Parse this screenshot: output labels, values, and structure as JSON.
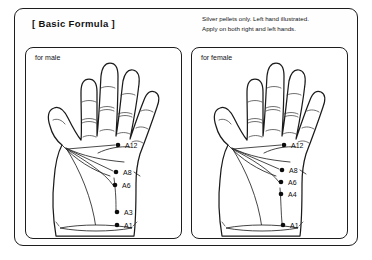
{
  "document": {
    "title": "[ Basic Formula ]",
    "note_lines": [
      "Silver pellets only. Left hand illustrated.",
      "Apply on both right and left hands."
    ]
  },
  "panels": [
    {
      "id": "male",
      "label": "for male",
      "hand": "left-hand-palm",
      "points": [
        {
          "code": "A12",
          "x": 92,
          "y": 97,
          "label_x": 99,
          "label_y": 100
        },
        {
          "code": "A8",
          "x": 90,
          "y": 124,
          "label_x": 97,
          "label_y": 127
        },
        {
          "code": "A6",
          "x": 89,
          "y": 137,
          "label_x": 96,
          "label_y": 140
        },
        {
          "code": "A3",
          "x": 91,
          "y": 164,
          "label_x": 98,
          "label_y": 167
        },
        {
          "code": "A1",
          "x": 91,
          "y": 177,
          "label_x": 98,
          "label_y": 180
        }
      ]
    },
    {
      "id": "female",
      "label": "for female",
      "hand": "left-hand-palm",
      "points": [
        {
          "code": "A12",
          "x": 92,
          "y": 97,
          "label_x": 99,
          "label_y": 100
        },
        {
          "code": "A8",
          "x": 90,
          "y": 122,
          "label_x": 97,
          "label_y": 125
        },
        {
          "code": "A6",
          "x": 89,
          "y": 134,
          "label_x": 96,
          "label_y": 137
        },
        {
          "code": "A4",
          "x": 89,
          "y": 146,
          "label_x": 96,
          "label_y": 149
        },
        {
          "code": "A1",
          "x": 91,
          "y": 177,
          "label_x": 98,
          "label_y": 180
        }
      ]
    }
  ],
  "colors": {
    "ink": "#1b1b1b",
    "point": "#0c0c0c",
    "paper": "#ffffff"
  }
}
